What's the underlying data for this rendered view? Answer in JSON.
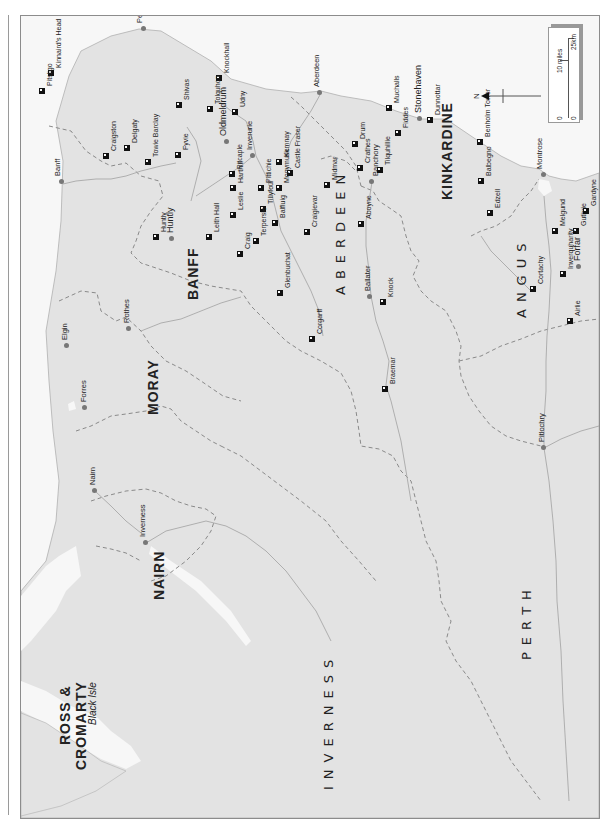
{
  "map": {
    "orientation": "rotated 90deg counter-clockwise (north points left)",
    "land_color": "#e3e3e3",
    "sea_color": "#f7f7f7",
    "boundary_color": "#8a8a8a",
    "river_color": "#a8a8a8"
  },
  "counties": [
    {
      "name": "ROSS &",
      "x": 58,
      "y": 745
    },
    {
      "name": "CROMARTY",
      "x": 74,
      "y": 770
    },
    {
      "name": "NAIRN",
      "x": 152,
      "y": 600
    },
    {
      "name": "MORAY",
      "x": 146,
      "y": 415
    },
    {
      "name": "BANFF",
      "x": 186,
      "y": 300
    },
    {
      "name": "INVERNESS",
      "x": 322,
      "y": 790
    },
    {
      "name": "ABERDEEN",
      "x": 334,
      "y": 295
    },
    {
      "name": "KINKARDINE",
      "x": 440,
      "y": 200
    },
    {
      "name": "ANGUS",
      "x": 515,
      "y": 318
    },
    {
      "name": "PERTH",
      "x": 520,
      "y": 660
    }
  ],
  "islands": [
    {
      "name": "Black Isle",
      "x": 88,
      "y": 725
    }
  ],
  "towns": [
    {
      "name": "Peterhead",
      "x": 140,
      "y": 32,
      "dotx": 143,
      "doty": 28,
      "size": "town"
    },
    {
      "name": "Aberdeen",
      "x": 317,
      "y": 90,
      "dotx": 319,
      "doty": 92,
      "size": "town"
    },
    {
      "name": "Stonehaven",
      "x": 418,
      "y": 115,
      "dotx": 419,
      "doty": 118,
      "size": "bigtown"
    },
    {
      "name": "Oldmeldrum",
      "x": 223,
      "y": 138,
      "dotx": 226,
      "doty": 141,
      "size": "bigtown"
    },
    {
      "name": "Inverurie",
      "x": 250,
      "y": 147,
      "dotx": 252,
      "doty": 155,
      "size": "town"
    },
    {
      "name": "Banchory",
      "x": 376,
      "y": 188,
      "dotx": 371,
      "doty": 181,
      "size": "town"
    },
    {
      "name": "Banff",
      "x": 58,
      "y": 190,
      "dotx": 61,
      "doty": 181,
      "size": "town"
    },
    {
      "name": "Huntly",
      "x": 170,
      "y": 236,
      "dotx": 171,
      "doty": 238,
      "size": "bigtown"
    },
    {
      "name": "Montrose",
      "x": 540,
      "y": 181,
      "dotx": 543,
      "doty": 174,
      "size": "town"
    },
    {
      "name": "Forfar",
      "x": 577,
      "y": 262,
      "dotx": 578,
      "doty": 266,
      "size": "bigtown"
    },
    {
      "name": "Ballater",
      "x": 368,
      "y": 291,
      "dotx": 369,
      "doty": 296,
      "size": "town"
    },
    {
      "name": "Rothes",
      "x": 127,
      "y": 340,
      "dotx": 128,
      "doty": 328,
      "size": "town"
    },
    {
      "name": "Elgin",
      "x": 65,
      "y": 340,
      "dotx": 66,
      "doty": 345,
      "size": "town"
    },
    {
      "name": "Forres",
      "x": 84,
      "y": 398,
      "dotx": 84,
      "doty": 407,
      "size": "town"
    },
    {
      "name": "Nairn",
      "x": 93,
      "y": 486,
      "dotx": 94,
      "doty": 490,
      "size": "town"
    },
    {
      "name": "Inverness",
      "x": 143,
      "y": 532,
      "dotx": 145,
      "doty": 542,
      "size": "town"
    },
    {
      "name": "Pitlochry",
      "x": 542,
      "y": 440,
      "dotx": 543,
      "doty": 447,
      "size": "town"
    }
  ],
  "castles": [
    {
      "name": "Kinnaird's Head",
      "x": 51,
      "y": 68
    },
    {
      "name": "Pitsligo",
      "x": 42,
      "y": 86
    },
    {
      "name": "Knockhall",
      "x": 219,
      "y": 73
    },
    {
      "name": "Shivas",
      "x": 179,
      "y": 100
    },
    {
      "name": "Tolquhon",
      "x": 210,
      "y": 104
    },
    {
      "name": "Udny",
      "x": 235,
      "y": 107
    },
    {
      "name": "Craigston",
      "x": 106,
      "y": 151
    },
    {
      "name": "Delgaty",
      "x": 127,
      "y": 143
    },
    {
      "name": "Towie Barclay",
      "x": 148,
      "y": 157
    },
    {
      "name": "Fyvie",
      "x": 178,
      "y": 150
    },
    {
      "name": "Pitcaple",
      "x": 232,
      "y": 169
    },
    {
      "name": "Kemnay",
      "x": 279,
      "y": 157
    },
    {
      "name": "Castle Fraser",
      "x": 290,
      "y": 168
    },
    {
      "name": "Drum",
      "x": 355,
      "y": 139
    },
    {
      "name": "Muchalls",
      "x": 389,
      "y": 103
    },
    {
      "name": "Fiddes",
      "x": 398,
      "y": 128
    },
    {
      "name": "Dunnottar",
      "x": 430,
      "y": 115
    },
    {
      "name": "Crathes",
      "x": 360,
      "y": 163
    },
    {
      "name": "Tilquhillie",
      "x": 380,
      "y": 165
    },
    {
      "name": "Benholm Tower",
      "x": 480,
      "y": 137
    },
    {
      "name": "Midmar",
      "x": 327,
      "y": 180
    },
    {
      "name": "Harthill",
      "x": 233,
      "y": 183
    },
    {
      "name": "Pittichie",
      "x": 261,
      "y": 183
    },
    {
      "name": "Monymusk",
      "x": 279,
      "y": 183
    },
    {
      "name": "Balbegno",
      "x": 481,
      "y": 176
    },
    {
      "name": "Leith Hall",
      "x": 209,
      "y": 232
    },
    {
      "name": "Leslie",
      "x": 233,
      "y": 210
    },
    {
      "name": "Tillyfour",
      "x": 263,
      "y": 204
    },
    {
      "name": "Balfluig",
      "x": 275,
      "y": 218
    },
    {
      "name": "Craigievar",
      "x": 307,
      "y": 227
    },
    {
      "name": "Drum (Huntly)",
      "x": 156,
      "y": 232
    },
    {
      "name": "Craig",
      "x": 240,
      "y": 249
    },
    {
      "name": "Terpersie",
      "x": 256,
      "y": 236
    },
    {
      "name": "Aboyne",
      "x": 361,
      "y": 219
    },
    {
      "name": "Edzell",
      "x": 490,
      "y": 208
    },
    {
      "name": "Melgund",
      "x": 555,
      "y": 226
    },
    {
      "name": "Guthrie",
      "x": 576,
      "y": 226
    },
    {
      "name": "Gardyne",
      "x": 586,
      "y": 206
    },
    {
      "name": "Glenbuchat",
      "x": 280,
      "y": 288
    },
    {
      "name": "Knock",
      "x": 383,
      "y": 297
    },
    {
      "name": "Inverquharity",
      "x": 563,
      "y": 269
    },
    {
      "name": "Cortachy",
      "x": 533,
      "y": 284
    },
    {
      "name": "Airlie",
      "x": 570,
      "y": 316
    },
    {
      "name": "Corgarff",
      "x": 312,
      "y": 334
    },
    {
      "name": "Braemar",
      "x": 385,
      "y": 384
    }
  ],
  "castle_label_overrides": {
    "Drum (Huntly)": "Huntly"
  },
  "north_arrow": {
    "label": "N"
  },
  "scale_bar": {
    "miles_label": "10 miles",
    "km_label": "25km",
    "zero_miles": "0",
    "zero_km": "0"
  }
}
